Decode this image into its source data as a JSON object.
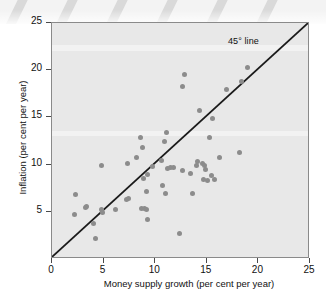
{
  "figure": {
    "background_color": "#ffffff",
    "plot_background_color": "#e8e8e8",
    "point_color": "#8c8c8c",
    "line_color": "#1a1a1a",
    "decoration": {
      "name": "diagonal-stripe-band",
      "stripe_color": "#d9d9d9",
      "band_color": "#f3f3f3",
      "stripe_count": 6
    }
  },
  "chart_data": {
    "type": "scatter",
    "title": "",
    "xlabel": "Money supply growth (per cent per year)",
    "ylabel": "Inflation (per cent per year)",
    "xlim": [
      0,
      25
    ],
    "ylim": [
      0,
      25
    ],
    "xticks": [
      0,
      5,
      10,
      15,
      20,
      25
    ],
    "yticks": [
      0,
      5,
      10,
      15,
      20,
      25
    ],
    "xtick_labels": [
      "0",
      "5",
      "10",
      "15",
      "20",
      "25"
    ],
    "ytick_labels": [
      "0",
      "5",
      "10",
      "15",
      "20",
      "25"
    ],
    "grid": false,
    "legend": null,
    "annotations": [
      {
        "text": "45° line",
        "x": 19.2,
        "y": 23.5
      }
    ],
    "reference_line": {
      "name": "45-degree-line",
      "type": "line",
      "x": [
        0,
        25
      ],
      "y": [
        0,
        25
      ],
      "label": "45° line",
      "color": "#1a1a1a",
      "width": 1.6
    },
    "series": [
      {
        "name": "Countries",
        "marker": "circle",
        "color": "#8c8c8c",
        "points": [
          [
            2.2,
            4.7
          ],
          [
            3.2,
            5.5
          ],
          [
            2.3,
            6.8
          ],
          [
            3.3,
            5.6
          ],
          [
            4.2,
            2.2
          ],
          [
            4.0,
            3.8
          ],
          [
            4.8,
            5.2
          ],
          [
            4.9,
            4.9
          ],
          [
            4.8,
            9.9
          ],
          [
            6.2,
            5.2
          ],
          [
            7.2,
            6.3
          ],
          [
            7.4,
            6.4
          ],
          [
            7.3,
            10.1
          ],
          [
            8.2,
            10.7
          ],
          [
            8.6,
            12.9
          ],
          [
            8.8,
            11.8
          ],
          [
            8.7,
            5.4
          ],
          [
            9.0,
            5.3
          ],
          [
            9.2,
            5.2
          ],
          [
            9.3,
            4.2
          ],
          [
            9.2,
            7.1
          ],
          [
            8.9,
            8.5
          ],
          [
            9.3,
            8.9
          ],
          [
            9.7,
            9.8
          ],
          [
            10.6,
            10.4
          ],
          [
            10.9,
            12.5
          ],
          [
            11.1,
            13.4
          ],
          [
            11.2,
            9.6
          ],
          [
            11.5,
            9.7
          ],
          [
            11.8,
            9.7
          ],
          [
            10.7,
            7.8
          ],
          [
            11.0,
            6.9
          ],
          [
            12.6,
            18.3
          ],
          [
            12.8,
            19.5
          ],
          [
            12.6,
            9.4
          ],
          [
            12.4,
            2.7
          ],
          [
            13.4,
            9.1
          ],
          [
            13.6,
            6.9
          ],
          [
            14.1,
            10.3
          ],
          [
            14.3,
            15.7
          ],
          [
            14.0,
            9.9
          ],
          [
            14.6,
            10.1
          ],
          [
            14.8,
            9.9
          ],
          [
            14.9,
            9.5
          ],
          [
            14.7,
            8.4
          ],
          [
            15.1,
            8.3
          ],
          [
            15.3,
            12.9
          ],
          [
            15.6,
            14.9
          ],
          [
            15.5,
            8.8
          ],
          [
            15.7,
            8.4
          ],
          [
            16.2,
            10.8
          ],
          [
            16.9,
            18.0
          ],
          [
            18.2,
            11.3
          ],
          [
            18.4,
            18.8
          ],
          [
            18.9,
            20.3
          ]
        ]
      }
    ]
  }
}
